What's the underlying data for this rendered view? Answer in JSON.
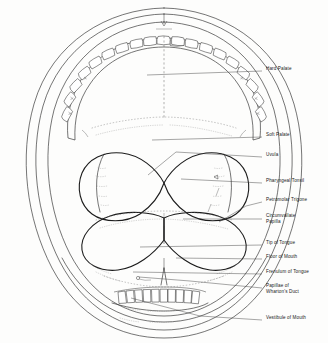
{
  "figure": {
    "view": "open-mouth anterior view",
    "background_color": "#fdfdfc",
    "line_color": "#2a2a2a",
    "label_color": "#1a1a1a"
  },
  "labels": [
    {
      "id": "hard-palate",
      "text": "Hard Palate",
      "x": 266,
      "y": 69,
      "leader_from_x": 147,
      "leader_from_y": 75,
      "leader_to_x": 262,
      "leader_to_y": 71
    },
    {
      "id": "soft-palate",
      "text": "Soft Palate",
      "x": 266,
      "y": 135,
      "leader_from_x": 152,
      "leader_from_y": 140,
      "leader_to_x": 262,
      "leader_to_y": 137
    },
    {
      "id": "uvula",
      "text": "Uvula",
      "x": 266,
      "y": 155,
      "leader_from_x": 148,
      "leader_from_y": 175,
      "leader_to_x": 262,
      "leader_to_y": 157
    },
    {
      "id": "pharyngeal-tonsil",
      "text": "Pharyngeal Tonsil",
      "x": 266,
      "y": 181,
      "leader_from_x": 181,
      "leader_from_y": 179,
      "leader_to_x": 262,
      "leader_to_y": 183
    },
    {
      "id": "petromolar-trigone",
      "text": "Petromolar Trigone",
      "x": 266,
      "y": 200,
      "leader_from_x": 219,
      "leader_from_y": 222,
      "leader_to_x": 262,
      "leader_to_y": 202
    },
    {
      "id": "circumvallate-papilla",
      "text": "Circumvallate\nPapilla",
      "x": 266,
      "y": 216,
      "leader_from_x": 183,
      "leader_from_y": 219,
      "leader_to_x": 262,
      "leader_to_y": 219
    },
    {
      "id": "tip-of-tongue",
      "text": "Tip of Tongue",
      "x": 266,
      "y": 243,
      "leader_from_x": 140,
      "leader_from_y": 247,
      "leader_to_x": 262,
      "leader_to_y": 245
    },
    {
      "id": "floor-of-mouth",
      "text": "Floor of Mouth",
      "x": 266,
      "y": 257,
      "leader_from_x": 176,
      "leader_from_y": 258,
      "leader_to_x": 262,
      "leader_to_y": 259
    },
    {
      "id": "frenulum-of-tongue",
      "text": "Frenulum of Tongue",
      "x": 266,
      "y": 272,
      "leader_from_x": 133,
      "leader_from_y": 272,
      "leader_to_x": 262,
      "leader_to_y": 274
    },
    {
      "id": "papillae-wharton",
      "text": "Papillae of\nWharton's Duct",
      "x": 266,
      "y": 286,
      "leader_from_x": 139,
      "leader_from_y": 277,
      "leader_to_x": 262,
      "leader_to_y": 288
    },
    {
      "id": "vestibule-of-mouth",
      "text": "Vestibule of Mouth",
      "x": 266,
      "y": 318,
      "leader_from_x": 131,
      "leader_from_y": 298,
      "leader_to_x": 262,
      "leader_to_y": 320
    }
  ],
  "anatomy_parts": [
    {
      "id": "outer-lip-contour",
      "name": "Outer Lip Contour"
    },
    {
      "id": "inner-lip-contour",
      "name": "Inner Lip Contour"
    },
    {
      "id": "cheek-contour",
      "name": "Cheek / Vestibule Contour"
    },
    {
      "id": "upper-dental-arch",
      "name": "Upper Dental Arch",
      "tooth_count": 16
    },
    {
      "id": "lower-incisors",
      "name": "Lower Incisors",
      "tooth_count": 8
    },
    {
      "id": "hard-palate-region",
      "name": "Hard Palate Region"
    },
    {
      "id": "soft-palate-region",
      "name": "Soft Palate Region"
    },
    {
      "id": "uvula-notch",
      "name": "Uvula Notch"
    },
    {
      "id": "tongue-body",
      "name": "Tongue Body"
    },
    {
      "id": "tonsil-lobes",
      "name": "Palatine Tonsil Lobes"
    },
    {
      "id": "midline-axis",
      "name": "Midline Axis"
    },
    {
      "id": "frenulum",
      "name": "Lingual Frenulum"
    }
  ]
}
